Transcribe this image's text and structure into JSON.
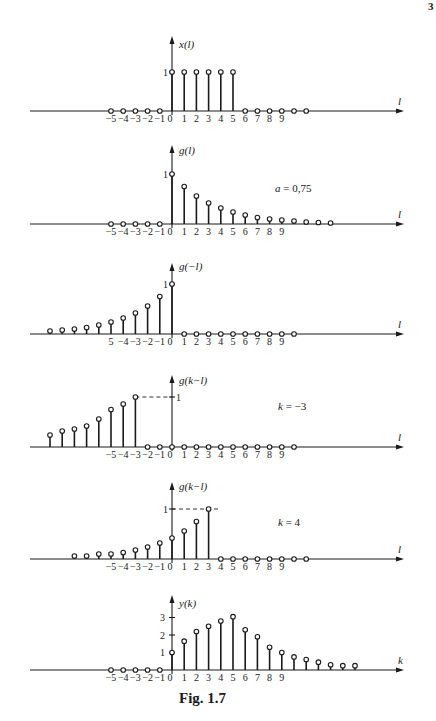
{
  "page_number": "3",
  "caption": "Fig. 1.7",
  "style": {
    "ink": "#1a1a1a",
    "background": "#ffffff"
  },
  "chart_data": [
    {
      "type": "stem",
      "title": "x(l)",
      "ylabel": "x(l)",
      "xlabel": "l",
      "x_tick_labels": [
        "-5",
        "-4",
        "-3",
        "-2",
        "-1",
        "0",
        "1",
        "2",
        "3",
        "4",
        "5",
        "6",
        "7",
        "8",
        "9"
      ],
      "y_tick_labels": [
        "1"
      ],
      "x": [
        -5,
        -4,
        -3,
        -2,
        -1,
        0,
        1,
        2,
        3,
        4,
        5,
        6,
        7,
        8,
        9,
        10,
        11
      ],
      "values": [
        0,
        0,
        0,
        0,
        0,
        1,
        1,
        1,
        1,
        1,
        1,
        0,
        0,
        0,
        0,
        0,
        0
      ],
      "annotation": ""
    },
    {
      "type": "stem",
      "title": "g(l)",
      "ylabel": "g(l)",
      "xlabel": "l",
      "x_tick_labels": [
        "-5",
        "-4",
        "-3",
        "-2",
        "-1",
        "0",
        "1",
        "2",
        "3",
        "4",
        "5",
        "6",
        "7",
        "8",
        "9"
      ],
      "y_tick_labels": [
        "1"
      ],
      "x": [
        -5,
        -4,
        -3,
        -2,
        -1,
        0,
        1,
        2,
        3,
        4,
        5,
        6,
        7,
        8,
        9,
        10,
        11,
        12,
        13
      ],
      "values": [
        0,
        0,
        0,
        0,
        0,
        1,
        0.75,
        0.56,
        0.42,
        0.32,
        0.24,
        0.18,
        0.13,
        0.1,
        0.08,
        0.06,
        0.04,
        0.03,
        0.02
      ],
      "annotation": "a = 0,75"
    },
    {
      "type": "stem",
      "title": "g(-l)",
      "ylabel": "g(−l)",
      "xlabel": "l",
      "x_tick_labels": [
        "5",
        "-4",
        "-3",
        "-2",
        "-1",
        "0",
        "1",
        "2",
        "3",
        "4",
        "5",
        "6",
        "7",
        "8",
        "9"
      ],
      "y_tick_labels": [
        "1"
      ],
      "x": [
        -10,
        -9,
        -8,
        -7,
        -6,
        -5,
        -4,
        -3,
        -2,
        -1,
        0,
        1,
        2,
        3,
        4,
        5,
        6,
        7,
        8,
        9,
        10
      ],
      "values": [
        0.06,
        0.08,
        0.1,
        0.13,
        0.18,
        0.24,
        0.32,
        0.42,
        0.56,
        0.75,
        1,
        0,
        0,
        0,
        0,
        0,
        0,
        0,
        0,
        0,
        0
      ],
      "annotation": ""
    },
    {
      "type": "stem",
      "title": "g(k-l), k = -3",
      "ylabel": "g(k−l)",
      "xlabel": "l",
      "x_tick_labels": [
        "-5",
        "-4",
        "-3",
        "-2",
        "-1",
        "0",
        "1",
        "2",
        "3",
        "4",
        "5",
        "6",
        "7",
        "8",
        "9"
      ],
      "y_tick_labels": [
        "1"
      ],
      "x": [
        -10,
        -9,
        -8,
        -7,
        -6,
        -5,
        -4,
        -3,
        -2,
        -1,
        0,
        1,
        2,
        3,
        4,
        5,
        6,
        7,
        8,
        9,
        10
      ],
      "values": [
        0.24,
        0.32,
        0.36,
        0.42,
        0.56,
        0.75,
        0.86,
        1,
        0,
        0,
        0,
        0,
        0,
        0,
        0,
        0,
        0,
        0,
        0,
        0,
        0
      ],
      "annotation": "k = −3"
    },
    {
      "type": "stem",
      "title": "g(k-l), k = 4",
      "ylabel": "g(k−l)",
      "xlabel": "l",
      "x_tick_labels": [
        "-5",
        "-4",
        "-3",
        "-2",
        "-1",
        "0",
        "1",
        "2",
        "3",
        "4",
        "5",
        "6",
        "7",
        "8",
        "9"
      ],
      "y_tick_labels": [
        "1"
      ],
      "x": [
        -8,
        -7,
        -6,
        -5,
        -4,
        -3,
        -2,
        -1,
        0,
        1,
        2,
        3,
        4,
        5,
        6,
        7,
        8,
        9,
        10,
        11
      ],
      "values": [
        0.06,
        0.06,
        0.1,
        0.1,
        0.13,
        0.18,
        0.24,
        0.32,
        0.42,
        0.56,
        0.75,
        1,
        0,
        0,
        0,
        0,
        0,
        0,
        0,
        0
      ],
      "annotation": "k = 4"
    },
    {
      "type": "stem",
      "title": "y(k)",
      "ylabel": "y(k)",
      "xlabel": "k",
      "x_tick_labels": [
        "-5",
        "-4",
        "-3",
        "-2",
        "-1",
        "0",
        "1",
        "2",
        "3",
        "4",
        "5",
        "6",
        "7",
        "8",
        "9"
      ],
      "y_tick_labels": [
        "1",
        "2",
        "3"
      ],
      "ylim": [
        0,
        3.2
      ],
      "x": [
        -5,
        -4,
        -3,
        -2,
        -1,
        0,
        1,
        2,
        3,
        4,
        5,
        6,
        7,
        8,
        9,
        10,
        11,
        12,
        13,
        14,
        15
      ],
      "values": [
        0,
        0,
        0,
        0,
        0,
        1,
        1.65,
        2.2,
        2.5,
        2.8,
        3.05,
        2.3,
        1.9,
        1.3,
        1.0,
        0.75,
        0.6,
        0.45,
        0.3,
        0.25,
        0.25
      ],
      "annotation": ""
    }
  ]
}
